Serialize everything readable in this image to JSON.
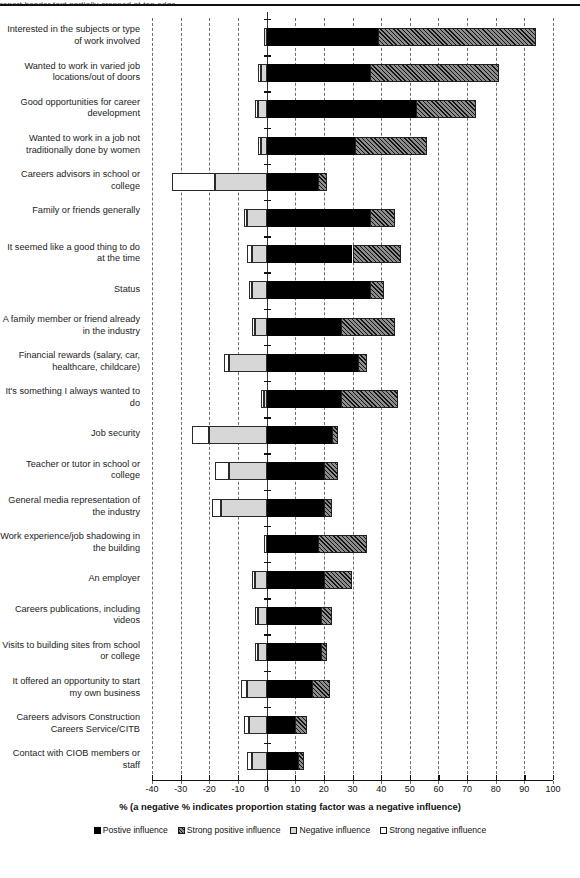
{
  "header": {
    "cropped_top_text": "report header text partially cropped at top edge"
  },
  "chart_data": {
    "type": "bar",
    "orientation": "horizontal",
    "stacked": true,
    "title": "",
    "xlabel": "% (a negative % indicates proportion stating factor was a negative influence)",
    "ylabel": "",
    "xlim": [
      -40,
      100
    ],
    "xticks": [
      -40,
      -30,
      -20,
      -10,
      0,
      10,
      20,
      30,
      40,
      50,
      60,
      70,
      80,
      90,
      100
    ],
    "xtick_labels": [
      "-40",
      "-30",
      "-20",
      "-10",
      "0",
      "10",
      "20",
      "30",
      "40",
      "50",
      "60",
      "70",
      "80",
      "90",
      "100"
    ],
    "grid": "vertical dashed gridlines at every 10 units",
    "legend_position": "bottom",
    "legend": [
      {
        "key": "positive",
        "label": "Postive influence",
        "style": "solid-black"
      },
      {
        "key": "strong_positive",
        "label": "Strong positive influence",
        "style": "hatched-grey"
      },
      {
        "key": "negative",
        "label": "Negative influence",
        "style": "light-grey"
      },
      {
        "key": "strong_negative",
        "label": "Strong negative influence",
        "style": "white"
      }
    ],
    "categories": [
      "Interested in the subjects or type of work involved",
      "Wanted to work in varied job locations/out of doors",
      "Good opportunities for career development",
      "Wanted to work in a job not traditionally done by women",
      "Careers advisors in school or college",
      "Family or friends generally",
      "It seemed like a good thing to do at the time",
      "Status",
      "A family member or friend already in the industry",
      "Financial rewards (salary, car, healthcare, childcare)",
      "It's something I always wanted to do",
      "Job security",
      "Teacher or tutor in school or college",
      "General media representation of the industry",
      "Work experience/job shadowing in the building",
      "An employer",
      "Careers publications, including videos",
      "Visits to building sites from school or college",
      "It offered an opportunity to start my own business",
      "Careers advisors Construction Careers Service/CITB",
      "Contact with CIOB members or staff"
    ],
    "series": [
      {
        "name": "Postive influence",
        "key": "positive",
        "values": [
          39,
          36,
          52,
          31,
          18,
          36,
          30,
          36,
          26,
          32,
          26,
          23,
          20,
          20,
          18,
          20,
          19,
          19,
          16,
          10,
          11
        ]
      },
      {
        "name": "Strong positive influence",
        "key": "strong_positive",
        "values": [
          55,
          45,
          21,
          25,
          3,
          9,
          17,
          5,
          19,
          3,
          20,
          2,
          5,
          3,
          17,
          10,
          4,
          2,
          6,
          4,
          2
        ]
      },
      {
        "name": "Negative influence",
        "key": "negative",
        "values": [
          -1,
          -2,
          -3,
          -2,
          -18,
          -7,
          -5,
          -5,
          -4,
          -13,
          -1,
          -20,
          -13,
          -16,
          0,
          -4,
          -3,
          -3,
          -7,
          -6,
          -5
        ]
      },
      {
        "name": "Strong negative influence",
        "key": "strong_negative",
        "values": [
          0,
          -1,
          -1,
          -1,
          -15,
          -1,
          -2,
          -1,
          -1,
          -2,
          -1,
          -6,
          -5,
          -3,
          -1,
          -1,
          -1,
          -1,
          -2,
          -2,
          -2
        ]
      }
    ]
  }
}
